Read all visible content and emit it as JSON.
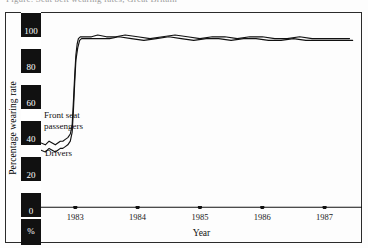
{
  "caption": "Figure: Seat belt wearing rates, Great Britain",
  "axes": {
    "ylabel": "Percentage wearing rate",
    "xlabel": "Year",
    "unit_label": "%",
    "yticks": [
      "100",
      "80",
      "60",
      "40",
      "20",
      "0"
    ],
    "xticks": [
      "1983",
      "1984",
      "1985",
      "1986",
      "1987"
    ]
  },
  "annotations": {
    "front_seat": "Front seat\npassengers",
    "drivers": "Drivers"
  },
  "colors": {
    "ink": "#111111",
    "tick_block_bg": "#111111",
    "tick_block_text": "#ffffff",
    "frame": "#2b2b2b"
  },
  "chart_data": {
    "type": "line",
    "title": "",
    "xlabel": "Year",
    "ylabel": "Percentage wearing rate",
    "xlim": [
      1982.45,
      1987.6
    ],
    "ylim": [
      0,
      108
    ],
    "grid": false,
    "legend": "inline-annotations",
    "xtick_values": [
      1983,
      1984,
      1985,
      1986,
      1987
    ],
    "ytick_values": [
      0,
      20,
      40,
      60,
      80,
      100
    ],
    "annotations": [
      {
        "text": "Front seat passengers",
        "x": 1982.72,
        "y": 47
      },
      {
        "text": "Drivers",
        "x": 1982.75,
        "y": 27
      }
    ],
    "series": [
      {
        "name": "Front seat passengers",
        "x": [
          1982.45,
          1982.52,
          1982.58,
          1982.63,
          1982.68,
          1982.72,
          1982.76,
          1982.8,
          1982.84,
          1982.88,
          1982.92,
          1982.95,
          1982.97,
          1982.99,
          1983.01,
          1983.03,
          1983.05,
          1983.08,
          1983.12,
          1983.18,
          1983.26,
          1983.36,
          1983.5,
          1983.65,
          1983.8,
          1984.0,
          1984.2,
          1984.4,
          1984.6,
          1984.8,
          1985.0,
          1985.2,
          1985.4,
          1985.6,
          1985.8,
          1986.0,
          1986.2,
          1986.4,
          1986.6,
          1986.8,
          1987.0,
          1987.2,
          1987.4
        ],
        "y": [
          35,
          34,
          36,
          35,
          34,
          35,
          36,
          36,
          37,
          38,
          40,
          45,
          58,
          72,
          84,
          90,
          93,
          94,
          94,
          94,
          94,
          95,
          94,
          94,
          95,
          94,
          93,
          94,
          95,
          94,
          93,
          94,
          94,
          93,
          94,
          94,
          93,
          93,
          94,
          93,
          93,
          93,
          93
        ]
      },
      {
        "name": "Drivers",
        "x": [
          1982.45,
          1982.52,
          1982.58,
          1982.63,
          1982.68,
          1982.72,
          1982.76,
          1982.8,
          1982.84,
          1982.88,
          1982.92,
          1982.95,
          1982.97,
          1982.99,
          1983.01,
          1983.04,
          1983.07,
          1983.1,
          1983.15,
          1983.22,
          1983.3,
          1983.42,
          1983.55,
          1983.7,
          1983.9,
          1984.1,
          1984.3,
          1984.5,
          1984.7,
          1984.9,
          1985.1,
          1985.3,
          1985.5,
          1985.7,
          1985.9,
          1986.1,
          1986.3,
          1986.5,
          1986.7,
          1986.9,
          1987.1,
          1987.3,
          1987.45
        ],
        "y": [
          31,
          30,
          32,
          31,
          30,
          31,
          32,
          32,
          33,
          34,
          36,
          41,
          53,
          68,
          81,
          88,
          92,
          93,
          93,
          93,
          93,
          93,
          93,
          94,
          93,
          92,
          93,
          94,
          93,
          92,
          93,
          93,
          92,
          93,
          93,
          92,
          92,
          93,
          92,
          92,
          92,
          92,
          92
        ]
      }
    ]
  }
}
